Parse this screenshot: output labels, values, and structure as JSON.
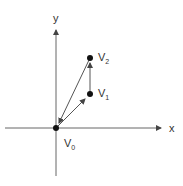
{
  "diagram": {
    "axes": {
      "x_label": "x",
      "y_label": "y"
    },
    "points": [
      {
        "name": "V",
        "sub": "0"
      },
      {
        "name": "V",
        "sub": "1"
      },
      {
        "name": "V",
        "sub": "2"
      }
    ],
    "colors": {
      "line": "#555555",
      "point": "#111111",
      "background": "#ffffff"
    }
  }
}
